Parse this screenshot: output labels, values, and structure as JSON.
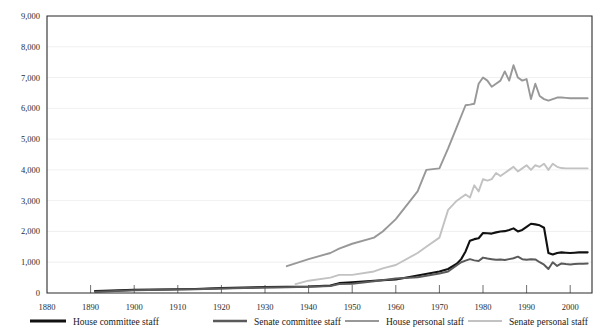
{
  "chart_data": {
    "type": "line",
    "title": "",
    "xlabel": "",
    "ylabel": "",
    "xlim": [
      1880,
      2005
    ],
    "ylim": [
      0,
      9000
    ],
    "grid": true,
    "legend_position": "bottom",
    "y_ticks": [
      "0",
      "1,000",
      "2,000",
      "3,000",
      "4,000",
      "5,000",
      "6,000",
      "7,000",
      "8,000",
      "9,000"
    ],
    "y_tick_values": [
      0,
      1000,
      2000,
      3000,
      4000,
      5000,
      6000,
      7000,
      8000,
      9000
    ],
    "x_ticks": [
      "1880",
      "1890",
      "1900",
      "1910",
      "1920",
      "1930",
      "1940",
      "1950",
      "1960",
      "1970",
      "1980",
      "1990",
      "2000"
    ],
    "x_tick_values": [
      1880,
      1890,
      1900,
      1910,
      1920,
      1930,
      1940,
      1950,
      1960,
      1970,
      1980,
      1990,
      2000
    ],
    "series": [
      {
        "name": "House committee staff",
        "color": "#111111",
        "width": 2.1,
        "x": [
          1891,
          1893,
          1900,
          1910,
          1914,
          1920,
          1930,
          1935,
          1940,
          1945,
          1947,
          1950,
          1955,
          1960,
          1965,
          1970,
          1972,
          1974,
          1975,
          1976,
          1977,
          1978,
          1979,
          1980,
          1981,
          1982,
          1983,
          1984,
          1985,
          1986,
          1987,
          1988,
          1989,
          1990,
          1991,
          1992,
          1993,
          1994,
          1995,
          1996,
          1997,
          1998,
          1999,
          2000,
          2001,
          2002,
          2003,
          2004
        ],
        "y": [
          62,
          70,
          100,
          120,
          130,
          160,
          190,
          200,
          210,
          240,
          320,
          350,
          400,
          440,
          570,
          700,
          780,
          950,
          1100,
          1350,
          1700,
          1750,
          1780,
          1950,
          1940,
          1930,
          1970,
          2000,
          2010,
          2050,
          2100,
          2000,
          2050,
          2150,
          2250,
          2230,
          2200,
          2120,
          1300,
          1250,
          1300,
          1320,
          1310,
          1300,
          1310,
          1320,
          1320,
          1320
        ]
      },
      {
        "name": "Senate committee staff",
        "color": "#5a5a5a",
        "width": 2.0,
        "x": [
          1891,
          1893,
          1900,
          1910,
          1914,
          1920,
          1930,
          1935,
          1940,
          1945,
          1947,
          1950,
          1955,
          1960,
          1965,
          1970,
          1972,
          1974,
          1975,
          1976,
          1977,
          1978,
          1979,
          1980,
          1981,
          1982,
          1983,
          1984,
          1985,
          1986,
          1987,
          1988,
          1989,
          1990,
          1991,
          1992,
          1993,
          1994,
          1995,
          1996,
          1997,
          1998,
          1999,
          2000,
          2001,
          2002,
          2003,
          2004
        ],
        "y": [
          41,
          50,
          90,
          110,
          120,
          150,
          180,
          190,
          200,
          230,
          290,
          300,
          380,
          470,
          510,
          635,
          700,
          900,
          1000,
          1050,
          1100,
          1060,
          1040,
          1150,
          1120,
          1100,
          1080,
          1090,
          1070,
          1100,
          1130,
          1180,
          1100,
          1080,
          1100,
          1090,
          1000,
          920,
          780,
          1000,
          880,
          960,
          940,
          930,
          940,
          950,
          950,
          960
        ]
      },
      {
        "name": "House personal staff",
        "color": "#989898",
        "width": 1.9,
        "x": [
          1935,
          1940,
          1945,
          1947,
          1950,
          1955,
          1957,
          1960,
          1965,
          1967,
          1970,
          1972,
          1974,
          1976,
          1977,
          1978,
          1979,
          1980,
          1981,
          1982,
          1983,
          1984,
          1985,
          1986,
          1987,
          1988,
          1989,
          1990,
          1991,
          1992,
          1993,
          1994,
          1995,
          1996,
          1997,
          1998,
          1999,
          2000,
          2001,
          2002,
          2003,
          2004
        ],
        "y": [
          870,
          1100,
          1300,
          1440,
          1600,
          1800,
          2000,
          2400,
          3300,
          4000,
          4050,
          4700,
          5400,
          6100,
          6120,
          6150,
          6800,
          7000,
          6900,
          6700,
          6800,
          6900,
          7200,
          6900,
          7400,
          7000,
          6900,
          6950,
          6300,
          6800,
          6400,
          6300,
          6250,
          6300,
          6350,
          6350,
          6340,
          6330,
          6330,
          6330,
          6330,
          6330
        ]
      },
      {
        "name": "Senate personal staff",
        "color": "#c2c2c2",
        "width": 1.9,
        "x": [
          1937,
          1940,
          1945,
          1947,
          1950,
          1955,
          1957,
          1960,
          1965,
          1967,
          1970,
          1972,
          1974,
          1976,
          1977,
          1978,
          1979,
          1980,
          1981,
          1982,
          1983,
          1984,
          1985,
          1986,
          1987,
          1988,
          1989,
          1990,
          1991,
          1992,
          1993,
          1994,
          1995,
          1996,
          1997,
          1998,
          1999,
          2000,
          2001,
          2002,
          2003,
          2004
        ],
        "y": [
          290,
          400,
          500,
          590,
          590,
          700,
          800,
          910,
          1300,
          1500,
          1800,
          2700,
          3000,
          3200,
          3100,
          3500,
          3300,
          3700,
          3650,
          3700,
          3900,
          3800,
          3900,
          4000,
          4100,
          3950,
          4050,
          4150,
          4000,
          4150,
          4100,
          4200,
          4000,
          4200,
          4100,
          4060,
          4050,
          4050,
          4050,
          4050,
          4050,
          4050
        ]
      }
    ]
  },
  "legend": {
    "items": [
      {
        "label": "House committee staff",
        "color": "#111111",
        "swatch": "legend-swatch-house-committee"
      },
      {
        "label": "Senate committee staff",
        "color": "#5a5a5a",
        "swatch": "legend-swatch-senate-committee"
      },
      {
        "label": "House personal staff",
        "color": "#989898",
        "swatch": "legend-swatch-house-personal"
      },
      {
        "label": "Senate personal staff",
        "color": "#c2c2c2",
        "swatch": "legend-swatch-senate-personal"
      }
    ]
  }
}
